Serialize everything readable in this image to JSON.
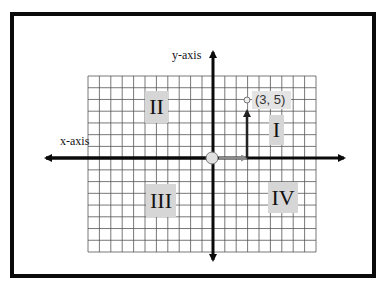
{
  "diagram": {
    "type": "coordinate-plane",
    "axes": {
      "x_label": "x-axis",
      "y_label": "y-axis"
    },
    "grid": {
      "columns": 20,
      "rows": 15,
      "columns_left_of_origin": 11,
      "columns_right_of_origin": 9,
      "rows_above_origin": 7,
      "rows_below_origin": 8
    },
    "quadrants": [
      {
        "id": "I",
        "label": "I"
      },
      {
        "id": "II",
        "label": "II"
      },
      {
        "id": "III",
        "label": "III"
      },
      {
        "id": "IV",
        "label": "IV"
      }
    ],
    "point": {
      "x": 3,
      "y": 5,
      "label": "(3, 5)"
    },
    "colors": {
      "frame": "#0a0a0a",
      "axis": "#0a0a0a",
      "grid_line": "#555555",
      "quadrant_box": "#d6d6d6",
      "x_step_arrow": "#8a8a8a",
      "y_step_arrow": "#222222",
      "origin_fill": "#e0e0e0"
    }
  }
}
